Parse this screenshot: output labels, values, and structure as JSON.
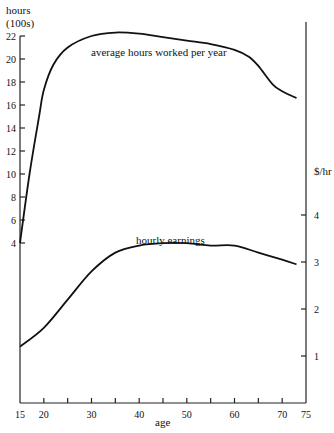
{
  "chart_data": {
    "type": "line",
    "title": "",
    "xlabel": "age",
    "left_axis": {
      "label_line1": "hours",
      "label_line2": "(100s)",
      "ticks": [
        4,
        6,
        8,
        10,
        12,
        14,
        16,
        18,
        20,
        22
      ],
      "range": [
        4,
        22
      ]
    },
    "right_axis": {
      "label": "$/hr",
      "ticks": [
        1,
        2,
        3,
        4
      ],
      "range": [
        0,
        4
      ]
    },
    "x_ticks": [
      15,
      20,
      30,
      40,
      50,
      60,
      70,
      75
    ],
    "x_minor_ticks": [
      25,
      35,
      45,
      55,
      65
    ],
    "xlim": [
      15,
      75
    ],
    "grid": false,
    "series": [
      {
        "name": "average hours worked per year",
        "axis": "left",
        "x": [
          15,
          17,
          19,
          20,
          22,
          25,
          30,
          35,
          40,
          45,
          50,
          55,
          60,
          63,
          65,
          68,
          70,
          73
        ],
        "values": [
          4,
          10,
          15,
          17.3,
          19.5,
          21,
          22,
          22.3,
          22.2,
          21.9,
          21.6,
          21.3,
          20.8,
          20.2,
          19.4,
          17.8,
          17.2,
          16.6
        ]
      },
      {
        "name": "hourly earnings",
        "axis": "right",
        "x": [
          15,
          20,
          25,
          30,
          35,
          40,
          45,
          50,
          55,
          60,
          65,
          70,
          73
        ],
        "values": [
          1.2,
          1.6,
          2.2,
          2.8,
          3.2,
          3.35,
          3.4,
          3.4,
          3.35,
          3.35,
          3.2,
          3.05,
          2.95
        ]
      }
    ],
    "annotations": [
      "average hours worked per year",
      "hourly earnings"
    ]
  }
}
